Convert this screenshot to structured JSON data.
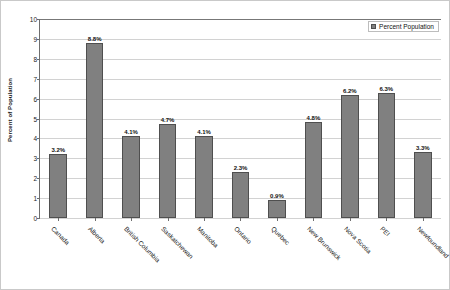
{
  "chart_data": {
    "type": "bar",
    "title": "",
    "xlabel": "",
    "ylabel": "Percent of Population",
    "ylim": [
      0,
      10
    ],
    "ytick_step": 1,
    "yticks": [
      "0",
      "1",
      "2",
      "3",
      "4",
      "5",
      "6",
      "7",
      "8",
      "9",
      "10"
    ],
    "grid": true,
    "legend_position": "top-right",
    "categories": [
      "Canada",
      "Alberta",
      "British Columbia",
      "Saskatchewan",
      "Manitoba",
      "Ontario",
      "Quebec",
      "New Brunswick",
      "Nova Scotia",
      "PEI",
      "Newfoundland"
    ],
    "values": [
      3.2,
      8.8,
      4.1,
      4.7,
      4.1,
      2.3,
      0.9,
      4.8,
      6.2,
      6.3,
      3.3
    ],
    "data_labels": [
      "3.2%",
      "8.8%",
      "4.1%",
      "4.7%",
      "4.1%",
      "2.3%",
      "0.9%",
      "4.8%",
      "6.2%",
      "6.3%",
      "3.3%"
    ],
    "series": [
      {
        "name": "Percent Population",
        "values": [
          3.2,
          8.8,
          4.1,
          4.7,
          4.1,
          2.3,
          0.9,
          4.8,
          6.2,
          6.3,
          3.3
        ]
      }
    ]
  },
  "legend": {
    "entries": [
      {
        "label": "Percent Population",
        "color": "#808080"
      }
    ]
  },
  "colors": {
    "bar_fill": "#808080",
    "bar_border": "#4f4f4f",
    "gridline": "#d2d2d2",
    "axis": "#6e6e6e",
    "text": "#1a1a1a",
    "background": "#ffffff"
  }
}
